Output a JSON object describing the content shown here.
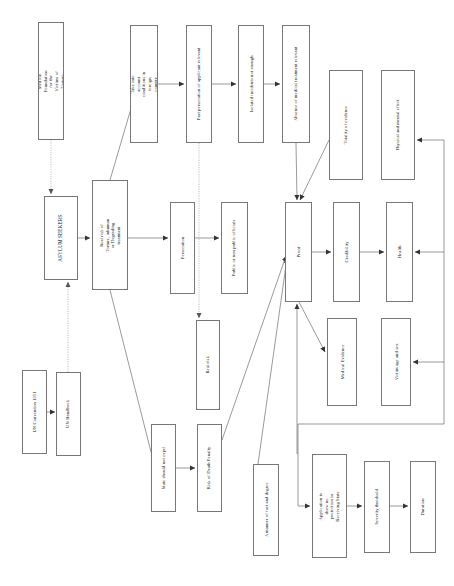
{
  "diagram": {
    "orientation": "vertical-text",
    "colors": {
      "box_border": "#777777",
      "edge_solid": "#555555",
      "edge_dotted": "#999999",
      "background": "#ffffff",
      "text": "#1a1a1a"
    },
    "nodes": [
      {
        "id": "medical_foundation",
        "label": "Medical Foundation for the Victims of Torture",
        "x": 38,
        "y": 22,
        "w": 26,
        "h": 118,
        "font": 4.6,
        "lines": 2,
        "width_px": 112
      },
      {
        "id": "take_into_account",
        "label": "Take into account conditions in foreign country",
        "x": 130,
        "y": 25,
        "w": 28,
        "h": 118,
        "font": 4.6,
        "lines": 2,
        "width_px": 112
      },
      {
        "id": "past_persecution",
        "label": "Past persecution of applicant relevant",
        "x": 186,
        "y": 25,
        "w": 26,
        "h": 118,
        "font": 4.6,
        "lines": 1,
        "width_px": 114
      },
      {
        "id": "isolated_incidents",
        "label": "Isolated incidents not enough",
        "x": 238,
        "y": 25,
        "w": 26,
        "h": 118,
        "font": 4.6,
        "lines": 1,
        "width_px": 114
      },
      {
        "id": "absence_medical",
        "label": "Absence of medical treatment relevant",
        "x": 282,
        "y": 25,
        "w": 28,
        "h": 118,
        "font": 4.6,
        "lines": 1,
        "width_px": 114
      },
      {
        "id": "totality_evidence",
        "label": "Totality of evidence",
        "x": 329,
        "y": 70,
        "w": 34,
        "h": 110,
        "font": 4.6,
        "lines": 1,
        "width_px": 106
      },
      {
        "id": "physical_mental",
        "label": "Physical and mental effect",
        "x": 381,
        "y": 70,
        "w": 34,
        "h": 110,
        "font": 4.6,
        "lines": 1,
        "width_px": 106
      },
      {
        "id": "asylum_seekers",
        "label": "ASYLUM SEEKERS",
        "x": 44,
        "y": 196,
        "w": 34,
        "h": 84,
        "font": 5.2,
        "lines": 1,
        "width_px": 80
      },
      {
        "id": "real_risk_torture",
        "label": "Real risk of Torture, inhuman or Degrading treatment",
        "x": 92,
        "y": 180,
        "w": 36,
        "h": 110,
        "font": 4.6,
        "lines": 2,
        "width_px": 106
      },
      {
        "id": "persecution",
        "label": "Persecution",
        "x": 170,
        "y": 202,
        "w": 25,
        "h": 92,
        "font": 4.6,
        "lines": 1,
        "width_px": 88
      },
      {
        "id": "public_officials",
        "label": "Public or non public officials",
        "x": 221,
        "y": 202,
        "w": 27,
        "h": 92,
        "font": 4.6,
        "lines": 1,
        "width_px": 88
      },
      {
        "id": "proof",
        "label": "Proof",
        "x": 285,
        "y": 202,
        "w": 27,
        "h": 100,
        "font": 4.8,
        "lines": 1,
        "width_px": 96
      },
      {
        "id": "credibility",
        "label": "Credibility",
        "x": 333,
        "y": 202,
        "w": 27,
        "h": 100,
        "font": 4.6,
        "lines": 1,
        "width_px": 96
      },
      {
        "id": "health",
        "label": "Health",
        "x": 386,
        "y": 202,
        "w": 27,
        "h": 100,
        "font": 4.6,
        "lines": 1,
        "width_px": 96
      },
      {
        "id": "real_risk",
        "label": "Real risk",
        "x": 196,
        "y": 320,
        "w": 24,
        "h": 90,
        "font": 4.6,
        "lines": 1,
        "width_px": 86
      },
      {
        "id": "medical_evidence",
        "label": "Medical Evidence",
        "x": 327,
        "y": 318,
        "w": 30,
        "h": 88,
        "font": 4.6,
        "lines": 1,
        "width_px": 84
      },
      {
        "id": "victim_age_sex",
        "label": "Victim age and sex",
        "x": 381,
        "y": 318,
        "w": 30,
        "h": 88,
        "font": 4.6,
        "lines": 1,
        "width_px": 84
      },
      {
        "id": "un_convention",
        "label": "UN Convention 1951",
        "x": 22,
        "y": 370,
        "w": 25,
        "h": 84,
        "font": 4.6,
        "lines": 1,
        "width_px": 80
      },
      {
        "id": "un_handbook",
        "label": "UN Handbook",
        "x": 56,
        "y": 372,
        "w": 25,
        "h": 84,
        "font": 4.6,
        "lines": 1,
        "width_px": 80
      },
      {
        "id": "state_not_expel",
        "label": "State should not expel",
        "x": 151,
        "y": 424,
        "w": 25,
        "h": 88,
        "font": 4.6,
        "lines": 1,
        "width_px": 84
      },
      {
        "id": "risk_death_penalty",
        "label": "Risk of Death Penalty",
        "x": 197,
        "y": 424,
        "w": 25,
        "h": 88,
        "font": 4.6,
        "lines": 1,
        "width_px": 84
      },
      {
        "id": "matter_fact_degree",
        "label": "A manner of fact and degree",
        "x": 253,
        "y": 464,
        "w": 26,
        "h": 92,
        "font": 4.6,
        "lines": 1,
        "width_px": 88
      },
      {
        "id": "application_protection",
        "label": "Application to show no protection in Receiving State",
        "x": 312,
        "y": 454,
        "w": 35,
        "h": 104,
        "font": 4.6,
        "lines": 2,
        "width_px": 100
      },
      {
        "id": "severity_threshold",
        "label": "Severity threshold",
        "x": 364,
        "y": 461,
        "w": 26,
        "h": 92,
        "font": 4.6,
        "lines": 1,
        "width_px": 88
      },
      {
        "id": "duration",
        "label": "Duration",
        "x": 410,
        "y": 461,
        "w": 26,
        "h": 92,
        "font": 4.6,
        "lines": 1,
        "width_px": 88
      }
    ],
    "edges": [
      {
        "id": "medfound-to-asylum",
        "from": "medical_foundation",
        "to": "asylum_seekers",
        "style": "dotted",
        "path": "M 51,140 L 51,194",
        "arrow": true
      },
      {
        "id": "unhandbook-to-asylum",
        "from": "un_handbook",
        "to": "asylum_seekers",
        "style": "dotted",
        "path": "M 68,372 L 68,282",
        "arrow": true
      },
      {
        "id": "unconv-to-unhandbook",
        "from": "un_convention",
        "to": "un_handbook",
        "style": "solid",
        "path": "M 47,412 L 55,412",
        "arrow": true
      },
      {
        "id": "asylum-to-realrisk",
        "from": "asylum_seekers",
        "to": "real_risk_torture",
        "style": "solid",
        "path": "M 78,238 L 90,238",
        "arrow": true
      },
      {
        "id": "realrisk-to-takeinto",
        "from": "real_risk_torture",
        "to": "take_into_account",
        "style": "solid",
        "path": "M 110,180 L 137,88",
        "arrow": false
      },
      {
        "id": "takeinto-to-past",
        "from": "take_into_account",
        "to": "past_persecution",
        "style": "solid",
        "path": "M 158,84 L 184,84",
        "arrow": true
      },
      {
        "id": "past-to-isolated",
        "from": "past_persecution",
        "to": "isolated_incidents",
        "style": "solid",
        "path": "M 212,84 L 236,84",
        "arrow": true
      },
      {
        "id": "isolated-to-absence",
        "from": "isolated_incidents",
        "to": "absence_medical",
        "style": "solid",
        "path": "M 264,84 L 280,84",
        "arrow": true
      },
      {
        "id": "realrisk-to-persecution",
        "from": "real_risk_torture",
        "to": "persecution",
        "style": "solid",
        "path": "M 128,238 L 168,238",
        "arrow": true
      },
      {
        "id": "persecution-to-public",
        "from": "persecution",
        "to": "public_officials",
        "style": "solid",
        "path": "M 195,238 L 219,238",
        "arrow": true
      },
      {
        "id": "past-to-realrisk2",
        "from": "past_persecution",
        "to": "real_risk",
        "style": "dotted",
        "path": "M 199,143 L 199,318",
        "arrow": true
      },
      {
        "id": "absence-to-proof",
        "from": "absence_medical",
        "to": "proof",
        "style": "solid",
        "path": "M 296,143 L 297,200",
        "arrow": true
      },
      {
        "id": "totality-to-proof",
        "from": "totality_evidence",
        "to": "proof",
        "style": "solid",
        "path": "M 329,140 L 300,200",
        "arrow": true
      },
      {
        "id": "proof-to-credibility",
        "from": "proof",
        "to": "credibility",
        "style": "solid",
        "path": "M 312,252 L 331,252",
        "arrow": true
      },
      {
        "id": "credibility-to-health",
        "from": "credibility",
        "to": "health",
        "style": "solid",
        "path": "M 360,252 L 384,252",
        "arrow": true
      },
      {
        "id": "proof-to-medevidence",
        "from": "proof",
        "to": "medical_evidence",
        "style": "solid",
        "path": "M 299,302 L 325,352",
        "arrow": true
      },
      {
        "id": "state-to-death",
        "from": "state_not_expel",
        "to": "risk_death_penalty",
        "style": "solid",
        "path": "M 176,468 L 195,468",
        "arrow": true
      },
      {
        "id": "realrisktorture-to-state",
        "from": "real_risk_torture",
        "to": "state_not_expel",
        "style": "solid",
        "path": "M 110,290 L 151,452",
        "arrow": false
      },
      {
        "id": "death-to-proof",
        "from": "risk_death_penalty",
        "to": "proof",
        "style": "solid",
        "path": "M 222,440 L 286,256",
        "arrow": true
      },
      {
        "id": "matter-to-proof",
        "from": "matter_fact_degree",
        "to": "proof",
        "style": "solid",
        "path": "M 258,464 L 287,258",
        "arrow": true
      },
      {
        "id": "application-to-proof",
        "from": "application_protection",
        "to": "proof",
        "style": "solid",
        "path": "M 297,454 L 297,304",
        "arrow": true
      },
      {
        "id": "application-in",
        "from": "feedback",
        "to": "application_protection",
        "style": "solid",
        "path": "M 444,424 L 298,424 L 298,506 L 310,506",
        "arrow": true
      },
      {
        "id": "feedback-to-victim",
        "from": "feedback",
        "to": "victim_age_sex",
        "style": "solid",
        "path": "M 444,424 L 444,362 L 413,362",
        "arrow": true
      },
      {
        "id": "feedback-to-health",
        "from": "feedback",
        "to": "health",
        "style": "solid",
        "path": "M 444,362 L 444,252 L 415,252",
        "arrow": true
      },
      {
        "id": "feedback-to-physical",
        "from": "feedback",
        "to": "physical_mental",
        "style": "solid",
        "path": "M 444,252 L 444,140 L 417,140",
        "arrow": true
      },
      {
        "id": "application-to-severity",
        "from": "application_protection",
        "to": "severity_threshold",
        "style": "solid",
        "path": "M 347,506 L 362,506",
        "arrow": true
      },
      {
        "id": "severity-to-duration",
        "from": "severity_threshold",
        "to": "duration",
        "style": "solid",
        "path": "M 390,506 L 408,506",
        "arrow": true
      }
    ]
  }
}
